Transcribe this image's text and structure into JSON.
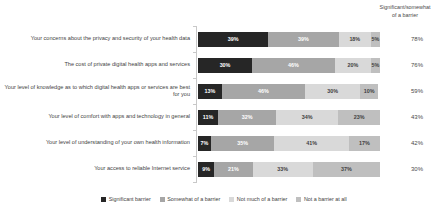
{
  "header": {
    "summary_column_line1": "Significant/somewhat",
    "summary_column_line2": "of a barrier"
  },
  "chart_data": {
    "type": "bar",
    "orientation": "horizontal",
    "stacked": true,
    "normalized_percent": true,
    "title": "",
    "xlabel": "",
    "ylabel": "",
    "xlim": [
      0,
      100
    ],
    "grid": false,
    "legend_position": "bottom",
    "categories": [
      "Your concerns about the privacy and security of your health data",
      "The cost of private digital health apps and services",
      "Your level of knowledge as to which digital health apps or services are best for you",
      "Your level of comfort with apps and technology in general",
      "Your level of understanding of your own health information",
      "Your access to reliable Internet service"
    ],
    "series": [
      {
        "name": "Significant barrier",
        "values": [
          39,
          30,
          13,
          11,
          7,
          9
        ],
        "color": "#262626"
      },
      {
        "name": "Somewhat of a barrier",
        "values": [
          39,
          46,
          46,
          32,
          35,
          21
        ],
        "color": "#a6a6a6"
      },
      {
        "name": "Not much of a barrier",
        "values": [
          18,
          20,
          30,
          34,
          41,
          33
        ],
        "color": "#d9d9d9"
      },
      {
        "name": "Not a barrier at all",
        "values": [
          5,
          5,
          10,
          23,
          17,
          37
        ],
        "color": "#bfbfbf"
      }
    ],
    "data_labels": [
      [
        "39%",
        "39%",
        "18%",
        "5%"
      ],
      [
        "30%",
        "46%",
        "20%",
        "5%"
      ],
      [
        "13%",
        "46%",
        "30%",
        "10%"
      ],
      [
        "11%",
        "32%",
        "34%",
        "23%"
      ],
      [
        "7%",
        "35%",
        "41%",
        "17%"
      ],
      [
        "9%",
        "21%",
        "33%",
        "37%"
      ]
    ],
    "summary_totals": [
      "78%",
      "76%",
      "59%",
      "43%",
      "42%",
      "30%"
    ]
  }
}
